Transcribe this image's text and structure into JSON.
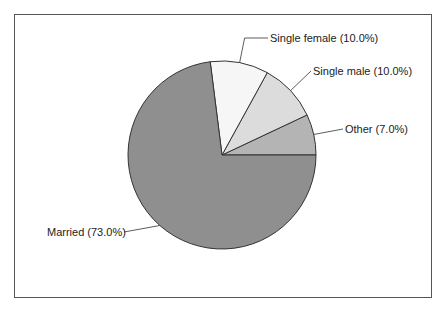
{
  "chart_data": {
    "type": "pie",
    "title": "",
    "slices": [
      {
        "label": "Other",
        "value": 7.0,
        "display": "Other (7.0%)",
        "color": "#b4b4b4"
      },
      {
        "label": "Single male",
        "value": 10.0,
        "display": "Single male (10.0%)",
        "color": "#dcdcdc"
      },
      {
        "label": "Single female",
        "value": 10.0,
        "display": "Single female (10.0%)",
        "color": "#f6f6f6"
      },
      {
        "label": "Married",
        "value": 73.0,
        "display": "Married (73.0%)",
        "color": "#8f8f8f"
      }
    ],
    "start_angle_deg": 0,
    "direction": "counterclockwise",
    "legend": "none",
    "labels": "outside with leader lines"
  }
}
